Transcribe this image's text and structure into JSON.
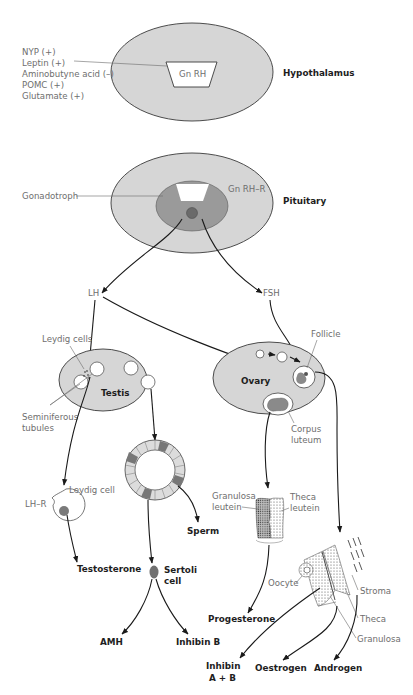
{
  "diagram": {
    "type": "hypothalamic-pituitary-gonadal axis",
    "hypothalamus": {
      "label": "Hypothalamus",
      "hormone": "Gn RH",
      "modulators": [
        "NYP (+)",
        "Leptin (+)",
        "Aminobutyne acid (–)",
        "POMC (+)",
        "Glutamate (+)"
      ]
    },
    "pituitary": {
      "label": "Pituitary",
      "receptor": "Gn RH–R",
      "cell": "Gonadotroph"
    },
    "gonadotrophins": {
      "lh": "LH",
      "fsh": "FSH"
    },
    "testis": {
      "label": "Testis",
      "leydig_cells": "Leydig cells",
      "seminiferous": [
        "Seminiferous",
        "tubules"
      ],
      "leydig_cell": "Leydig cell",
      "lh_receptor": "LH–R",
      "sperm": "Sperm",
      "sertoli": [
        "Sertoli",
        "cell"
      ],
      "outputs": {
        "testosterone": "Testosterone",
        "amh": "AMH",
        "inhibin_b": "Inhibin B"
      }
    },
    "ovary": {
      "label": "Ovary",
      "follicle": "Follicle",
      "corpus_luteum": [
        "Corpus",
        "luteum"
      ],
      "granulosa_leutein": [
        "Granulosa",
        "leutein"
      ],
      "theca_leutein": [
        "Theca",
        "leutein"
      ],
      "oocyte": "Oocyte",
      "stroma": "Stroma",
      "theca": "Theca",
      "granulosa": "Granulosa",
      "outputs": {
        "progesterone": "Progesterone",
        "inhibin_ab": [
          "Inhibin",
          "A + B"
        ],
        "oestrogen": "Oestrogen",
        "androgen": "Androgen"
      }
    },
    "colors": {
      "organ_fill": "#d6d6d6",
      "cell_dark": "#8c8c8c",
      "outline": "#3a3a3a",
      "label_gray": "#6e6e6e",
      "label_bold": "#1e1e1e"
    }
  }
}
